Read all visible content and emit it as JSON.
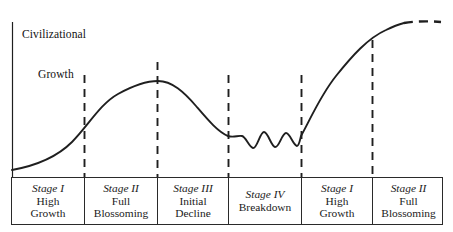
{
  "figure": {
    "axis_label_line1": "Civilizational",
    "axis_label_line2": "Growth",
    "curve_color": "#1f1f1f",
    "axis_color": "#1f1f1f",
    "divider_color": "#1f1f1f",
    "table_border_color": "#2a2a2a",
    "background_color": "#ffffff"
  },
  "stages": [
    {
      "roman": "Stage I",
      "desc": "High\nGrowth"
    },
    {
      "roman": "Stage II",
      "desc": "Full\nBlossoming"
    },
    {
      "roman": "Stage III",
      "desc": "Initial\nDecline"
    },
    {
      "roman": "Stage IV",
      "desc": "Breakdown"
    },
    {
      "roman": "Stage I",
      "desc": "High\nGrowth"
    },
    {
      "roman": "Stage II",
      "desc": "Full\nBlossoming"
    }
  ],
  "chart_data": {
    "type": "line",
    "xlabel": "",
    "ylabel": "Civilizational Growth",
    "grid": false,
    "legend": "none",
    "xlim": [
      0,
      453
    ],
    "ylim": [
      0,
      232
    ],
    "axis_origin_px": {
      "x": 12,
      "y": 177
    },
    "axis_top_px": {
      "x": 12,
      "y": 22
    },
    "stage_boundaries_px": [
      84,
      157,
      228,
      301,
      372
    ],
    "curve_solid_path": "M 12,170 C 34,166 56,158 72,142 C 88,126 100,104 118,94 C 136,84 150,81 158,81 C 172,81 184,92 196,106 C 208,120 218,132 228,136 C 234,138 238,135 242,136 C 246,137 249,147 253,148 C 257,149 260,132 264,132 C 268,132 271,146 275,147 C 279,148 282,133 286,133 C 290,133 293,145 297,146 C 299,146 300,140 301,136 C 310,120 320,96 336,76 C 352,56 368,38 386,30 C 394,26 400,24 404,23",
    "curve_dashed_path": "M 404,23 C 416,21 430,21 441,22",
    "curve_description": "S-shaped growth to a peak, decline into an oscillating breakdown trough, then renewed S-shaped growth ending in a dashed (projected) plateau",
    "key_points": [
      {
        "label": "start",
        "x": 12,
        "y": 170,
        "note": "low initial growth"
      },
      {
        "label": "first peak",
        "x": 158,
        "y": 81,
        "note": "end of Stage II Full Blossoming"
      },
      {
        "label": "breakdown trough",
        "x": 265,
        "y": 140,
        "note": "oscillating Stage IV Breakdown"
      },
      {
        "label": "second plateau",
        "x": 404,
        "y": 23,
        "note": "Stage II Full Blossoming, projected"
      }
    ]
  }
}
